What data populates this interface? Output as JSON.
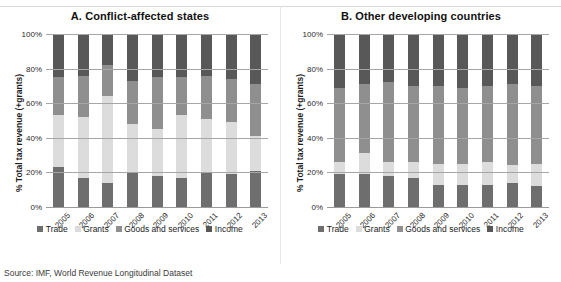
{
  "figure": {
    "top_clipped_text": "",
    "source_note": "Source: IMF, World Revenue Longitudinal Dataset"
  },
  "legend": {
    "items": [
      {
        "label": "Trade",
        "color": "#6e6e6e"
      },
      {
        "label": "Grants",
        "color": "#dcdcdc"
      },
      {
        "label": "Goods and services",
        "color": "#8f8f8f"
      },
      {
        "label": "Income",
        "color": "#585858"
      }
    ]
  },
  "axis": {
    "ylabel": "% Total tax revenue (+grants)",
    "yticks": [
      "0%",
      "20%",
      "40%",
      "60%",
      "80%",
      "100%"
    ]
  },
  "chart_data": [
    {
      "type": "bar",
      "stacked": true,
      "title": "A. Conflict-affected states",
      "xlabel": "",
      "ylabel": "% Total tax revenue (+grants)",
      "ylim": [
        0,
        100
      ],
      "yticks": [
        0,
        20,
        40,
        60,
        80,
        100
      ],
      "grid": true,
      "legend_position": "bottom",
      "categories": [
        "2005",
        "2006",
        "2007",
        "2008",
        "2009",
        "2010",
        "2011",
        "2012",
        "2013"
      ],
      "series": [
        {
          "name": "Trade",
          "color": "#6e6e6e",
          "values": [
            23,
            17,
            14,
            20,
            18,
            17,
            20,
            19,
            21
          ]
        },
        {
          "name": "Grants",
          "color": "#dcdcdc",
          "values": [
            30,
            35,
            50,
            28,
            27,
            36,
            31,
            30,
            20
          ]
        },
        {
          "name": "Goods and services",
          "color": "#8f8f8f",
          "values": [
            22,
            24,
            18,
            25,
            30,
            22,
            25,
            25,
            30
          ]
        },
        {
          "name": "Income",
          "color": "#585858",
          "values": [
            25,
            24,
            18,
            27,
            25,
            25,
            24,
            26,
            29
          ]
        }
      ]
    },
    {
      "type": "bar",
      "stacked": true,
      "title": "B. Other developing countries",
      "xlabel": "",
      "ylabel": "% Total tax revenue (+grants)",
      "ylim": [
        0,
        100
      ],
      "yticks": [
        0,
        20,
        40,
        60,
        80,
        100
      ],
      "grid": true,
      "legend_position": "bottom",
      "categories": [
        "2005",
        "2006",
        "2007",
        "2008",
        "2009",
        "2010",
        "2011",
        "2012",
        "2013"
      ],
      "series": [
        {
          "name": "Trade",
          "color": "#6e6e6e",
          "values": [
            19,
            19,
            18,
            17,
            13,
            13,
            13,
            14,
            12
          ]
        },
        {
          "name": "Grants",
          "color": "#dcdcdc",
          "values": [
            7,
            12,
            8,
            9,
            12,
            12,
            13,
            10,
            13
          ]
        },
        {
          "name": "Goods and services",
          "color": "#8f8f8f",
          "values": [
            43,
            40,
            46,
            44,
            45,
            44,
            44,
            47,
            45
          ]
        },
        {
          "name": "Income",
          "color": "#585858",
          "values": [
            31,
            29,
            28,
            30,
            30,
            31,
            30,
            29,
            30
          ]
        }
      ]
    }
  ]
}
